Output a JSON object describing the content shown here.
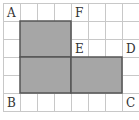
{
  "diagram": {
    "grid": {
      "origin_x": 3,
      "origin_y": 3,
      "cell_w": 17,
      "cell_h": 18,
      "cols": 8,
      "rows": 6,
      "line_color": "#c8c8c8"
    },
    "shaded_regions": [
      {
        "name": "upper-left-rect",
        "col": 1,
        "row": 1,
        "w": 3,
        "h": 2
      },
      {
        "name": "lower-left-rect",
        "col": 1,
        "row": 3,
        "w": 3,
        "h": 2
      },
      {
        "name": "lower-right-rect",
        "col": 4,
        "row": 3,
        "w": 3,
        "h": 2
      }
    ],
    "fill_color": "#a6a6a6",
    "outline_color": "#555555",
    "points": [
      {
        "label": "A",
        "col": 0,
        "row": 0
      },
      {
        "label": "F",
        "col": 4,
        "row": 0
      },
      {
        "label": "E",
        "col": 4,
        "row": 2
      },
      {
        "label": "D",
        "col": 7,
        "row": 2
      },
      {
        "label": "B",
        "col": 0,
        "row": 5
      },
      {
        "label": "C",
        "col": 7,
        "row": 5
      }
    ]
  }
}
